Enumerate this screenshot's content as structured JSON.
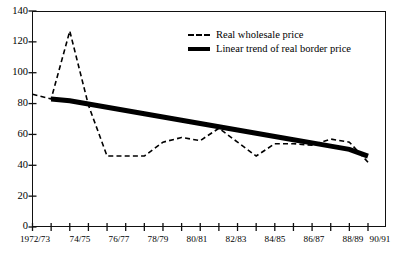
{
  "chart_data": {
    "type": "line",
    "title": "",
    "xlabel": "",
    "ylabel": "",
    "ylim": [
      0,
      140
    ],
    "ytick_values": [
      0,
      20,
      40,
      60,
      80,
      100,
      120,
      140
    ],
    "grid": false,
    "legend_position": "top-right",
    "x": [
      "1972/73",
      "1973/74",
      "1974/75",
      "1975/76",
      "1976/77",
      "1977/78",
      "1978/79",
      "1979/80",
      "1980/81",
      "1981/82",
      "1982/83",
      "1983/84",
      "1984/85",
      "1985/86",
      "1986/87",
      "1987/88",
      "1988/89",
      "1989/90",
      "1990/91"
    ],
    "xtick_labels": [
      "1972/73",
      "",
      "74/75",
      "",
      "76/77",
      "",
      "78/79",
      "",
      "80/81",
      "",
      "82/83",
      "",
      "84/85",
      "",
      "86/87",
      "",
      "88/89",
      "",
      "90/91"
    ],
    "series": [
      {
        "name": "Real wholesale price",
        "style": "dashed",
        "color": "#000000",
        "values": [
          86,
          83,
          127,
          79,
          46,
          46,
          46,
          55,
          58,
          56,
          64,
          55,
          46,
          54,
          54,
          53,
          57,
          55,
          42
        ]
      },
      {
        "name": "Linear trend of real border price",
        "style": "solid-thick",
        "color": "#000000",
        "values": [
          null,
          83,
          81.8,
          79.7,
          77.6,
          75.5,
          73.4,
          71.3,
          69.2,
          67.1,
          65,
          62.9,
          60.8,
          58.7,
          56.6,
          54.5,
          52.4,
          50.3,
          46
        ]
      }
    ]
  },
  "legend": {
    "items": [
      {
        "label": "Real wholesale price",
        "sample": "dashed-line-sample"
      },
      {
        "label": "Linear trend of real border price",
        "sample": "solid-bold-line-sample"
      }
    ]
  },
  "axes": {
    "y_labels": [
      "140",
      "120",
      "100",
      "80",
      "60",
      "40",
      "20",
      "0"
    ],
    "x_labels": [
      "1972/73",
      "74/75",
      "76/77",
      "78/79",
      "80/81",
      "82/83",
      "84/85",
      "86/87",
      "88/89",
      "90/91"
    ]
  }
}
